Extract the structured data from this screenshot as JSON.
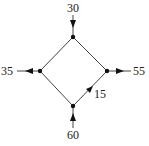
{
  "diagram": {
    "type": "flow-network",
    "nodes": [
      {
        "id": "top",
        "x": 73,
        "y": 37
      },
      {
        "id": "left",
        "x": 40,
        "y": 71
      },
      {
        "id": "right",
        "x": 107,
        "y": 71
      },
      {
        "id": "bottom",
        "x": 73,
        "y": 106
      }
    ],
    "external_flows": [
      {
        "node": "top",
        "direction": "in",
        "value": "30"
      },
      {
        "node": "left",
        "direction": "out",
        "value": "35"
      },
      {
        "node": "right",
        "direction": "out",
        "value": "55"
      },
      {
        "node": "bottom",
        "direction": "in",
        "value": "60"
      }
    ],
    "edges": [
      {
        "from": "top",
        "to": "left",
        "label": ""
      },
      {
        "from": "top",
        "to": "right",
        "label": ""
      },
      {
        "from": "left",
        "to": "bottom",
        "label": ""
      },
      {
        "from": "bottom",
        "to": "right",
        "label": "15"
      }
    ],
    "labels": {
      "top_in": "30",
      "left_out": "35",
      "right_out": "55",
      "bottom_in": "60",
      "edge_bottom_right": "15"
    },
    "colors": {
      "line": "#333333",
      "node": "#111111",
      "text": "#222222"
    }
  }
}
